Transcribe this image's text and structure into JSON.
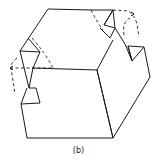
{
  "figure": {
    "caption": "(b)",
    "line_color": "#1a1a1a",
    "background": "#ffffff"
  }
}
